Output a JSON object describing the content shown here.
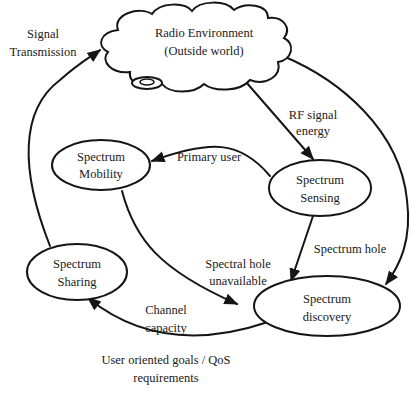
{
  "diagram": {
    "type": "cognitive-radio-cycle",
    "nodes": {
      "radio_environment": {
        "line1": "Radio Environment",
        "line2": "(Outside world)"
      },
      "spectrum_mobility": {
        "line1": "Spectrum",
        "line2": "Mobility"
      },
      "spectrum_sensing": {
        "line1": "Spectrum",
        "line2": "Sensing"
      },
      "spectrum_sharing": {
        "line1": "Spectrum",
        "line2": "Sharing"
      },
      "spectrum_discovery": {
        "line1": "Spectrum",
        "line2": "discovery"
      }
    },
    "edges": {
      "signal_transmission": {
        "line1": "Signal",
        "line2": "Transmission",
        "from": "spectrum_sharing",
        "to": "radio_environment"
      },
      "rf_signal_energy": {
        "line1": "RF signal",
        "line2": "energy",
        "from": "radio_environment",
        "to": "spectrum_sensing"
      },
      "primary_user": {
        "line1": "Primary user",
        "from": "spectrum_sensing",
        "to": "spectrum_mobility"
      },
      "spectrum_hole": {
        "line1": "Spectrum hole",
        "from": "spectrum_sensing",
        "to": "spectrum_discovery"
      },
      "spectral_hole_unavailable": {
        "line1": "Spectral hole",
        "line2": "unavailable",
        "from": "spectrum_mobility",
        "to": "spectrum_discovery"
      },
      "channel_capacity": {
        "line1": "Channel",
        "line2": "capacity",
        "from": "spectrum_discovery",
        "to": "spectrum_sharing"
      },
      "environment_to_discovery": {
        "from": "radio_environment",
        "to": "spectrum_discovery"
      }
    },
    "footer": {
      "line1": "User oriented goals / QoS",
      "line2": "requirements"
    }
  }
}
